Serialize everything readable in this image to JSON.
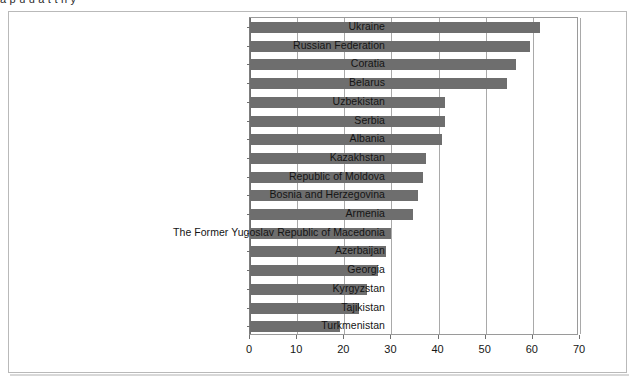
{
  "page": {
    "caption_sliver": "a p u     u         a  t     t      n    y"
  },
  "chart_data": {
    "type": "bar",
    "orientation": "horizontal",
    "title": "",
    "subtitle": "",
    "xlabel": "",
    "ylabel": "",
    "xlim": [
      0,
      70
    ],
    "xticks": [
      0,
      10,
      20,
      30,
      40,
      50,
      60,
      70
    ],
    "tick_labels": [
      "0",
      "10",
      "20",
      "30",
      "40",
      "50",
      "60",
      "70"
    ],
    "grid": true,
    "grid_axis": "x",
    "legend": false,
    "legend_position": "none",
    "bar_color": "#6e6e6e",
    "plot_border_color": "#9a9a9a",
    "frame_color": "#b9b9b9",
    "categories": [
      "Ukraine",
      "Russian Federation",
      "Coratia",
      "Belarus",
      "Uzbekistan",
      "Serbia",
      "Albania",
      "Kazakhstan",
      "Republic of Moldova",
      "Bosnia and Herzegovina",
      "Armenia",
      "The Former Yugoslav Republic of Macedonia",
      "Azerbaijan",
      "Georgia",
      "Kyrgyzstan",
      "Tajikistan",
      "Turkmenistan"
    ],
    "values": [
      61.5,
      59.3,
      56.5,
      54.6,
      41.3,
      41.3,
      40.7,
      37.4,
      36.6,
      35.7,
      34.6,
      29.9,
      28.9,
      27.2,
      24.9,
      23.2,
      19.1
    ],
    "series": [
      {
        "name": "value",
        "color": "#6e6e6e",
        "values": [
          61.5,
          59.3,
          56.5,
          54.6,
          41.3,
          41.3,
          40.7,
          37.4,
          36.6,
          35.7,
          34.6,
          29.9,
          28.9,
          27.2,
          24.9,
          23.2,
          19.1
        ]
      }
    ]
  }
}
